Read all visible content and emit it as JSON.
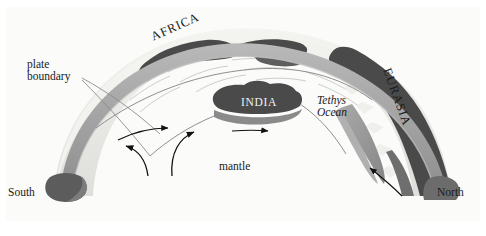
{
  "figure": {
    "type": "geological-cross-section-diagram",
    "background_color": "#ffffff",
    "panel_color": "#fbfbfa"
  },
  "labels": {
    "plate_boundary": "plate\nboundary",
    "africa": "AFRICA",
    "eurasia": "EURASIA",
    "india": "INDIA",
    "tethys_ocean": "Tethys\nOcean",
    "mantle": "mantle",
    "south": "South",
    "north": "North"
  },
  "colors": {
    "landmass_dark": "#4a4a4a",
    "landmass_mid": "#6e6e6e",
    "crust_band": "#9a9a9a",
    "crust_band_light": "#b5b5b5",
    "surface_light": "#ededea",
    "surface_shade": "#d8d8d4",
    "boundary_line": "#8c8c8c",
    "arrow": "#111111",
    "text_dark": "#1a1a1a",
    "text_light": "#f2f2f0"
  },
  "features": {
    "arch": "convex dome cross-section of lithosphere spanning South (left) to North (right)",
    "slab": "grey subducting slab descending beneath Eurasia on the right",
    "convection_arrows": 2,
    "plate_motion_arrows": 2,
    "subduction_arrow": 1,
    "leader_lines": 2
  }
}
